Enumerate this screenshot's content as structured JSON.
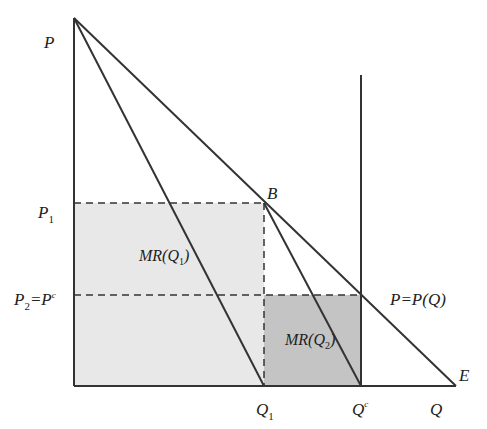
{
  "diagram": {
    "type": "economics-monopoly-marginal-revenue",
    "colors": {
      "line": "#333333",
      "light_fill": "#e8e8e8",
      "dark_fill": "#c4c4c4",
      "background": "#ffffff"
    },
    "points": {
      "origin": [
        74,
        386
      ],
      "apex": [
        74,
        18
      ],
      "B": [
        264,
        203
      ],
      "Q1": [
        264,
        386
      ],
      "Qc": [
        361,
        386
      ],
      "E": [
        456,
        386
      ],
      "demand_at_Qc": [
        361,
        295
      ],
      "capacity_top": [
        361,
        75
      ]
    },
    "labels": {
      "y_axis": "P",
      "p1": "P",
      "p1_sub": "1",
      "p2": "P",
      "p2_sub": "2",
      "p2_eq": "=P",
      "p2_sup": "c",
      "point_b": "B",
      "mr1_prefix": "MR(Q",
      "mr1_sub": "1",
      "mr1_suffix": ")",
      "mr2_prefix": "MR(Q",
      "mr2_sub": "2",
      "mr2_suffix": ")",
      "demand": "P=P(Q)",
      "point_e": "E",
      "q1": "Q",
      "q1_sub": "1",
      "qc": "Q",
      "qc_sup": "c",
      "x_axis": "Q"
    }
  }
}
